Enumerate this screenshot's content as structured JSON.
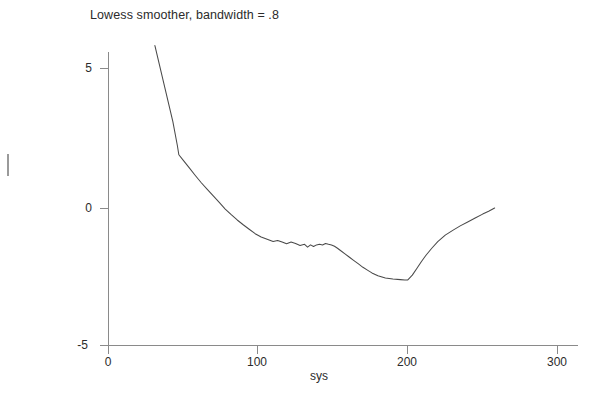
{
  "chart_data": {
    "type": "line",
    "title": "Lowess smoother, bandwidth = .8",
    "xlabel": "sys",
    "ylabel": "",
    "xlim": [
      0,
      310
    ],
    "ylim": [
      -5.3,
      6.3
    ],
    "xticks": [
      "0",
      "100",
      "200",
      "300"
    ],
    "xtick_values": [
      0,
      100,
      200,
      300
    ],
    "yticks": [
      "5",
      "0",
      "-5"
    ],
    "ytick_values": [
      5,
      0,
      -5
    ],
    "grid": false,
    "legend": "none",
    "series": [
      {
        "name": "lowess smooth",
        "color": "#4a4a4a",
        "x": [
          31,
          34,
          37,
          40,
          43,
          46,
          47,
          50,
          54,
          58,
          62,
          66,
          70,
          74,
          78,
          82,
          86,
          90,
          94,
          98,
          102,
          106,
          110,
          113,
          116,
          119,
          122,
          125,
          128,
          131,
          133,
          135,
          137,
          139,
          141,
          143,
          145,
          147,
          149,
          151,
          153,
          155,
          158,
          161,
          164,
          167,
          170,
          173,
          176,
          180,
          185,
          190,
          195,
          198,
          200,
          203,
          206,
          209,
          212,
          216,
          220,
          225,
          230,
          235,
          240,
          245,
          250,
          254,
          258
        ],
        "y": [
          5.82,
          5.14,
          4.46,
          3.78,
          3.1,
          2.25,
          1.92,
          1.72,
          1.45,
          1.18,
          0.92,
          0.68,
          0.45,
          0.22,
          -0.02,
          -0.22,
          -0.41,
          -0.58,
          -0.74,
          -0.9,
          -1.02,
          -1.1,
          -1.18,
          -1.14,
          -1.2,
          -1.26,
          -1.2,
          -1.25,
          -1.32,
          -1.28,
          -1.38,
          -1.3,
          -1.36,
          -1.3,
          -1.28,
          -1.3,
          -1.25,
          -1.28,
          -1.3,
          -1.35,
          -1.42,
          -1.5,
          -1.62,
          -1.74,
          -1.86,
          -1.98,
          -2.1,
          -2.2,
          -2.3,
          -2.4,
          -2.48,
          -2.52,
          -2.54,
          -2.55,
          -2.55,
          -2.38,
          -2.14,
          -1.9,
          -1.68,
          -1.42,
          -1.18,
          -0.95,
          -0.78,
          -0.62,
          -0.48,
          -0.34,
          -0.2,
          -0.1,
          0.02
        ]
      }
    ]
  },
  "figure": {
    "title": "Lowess smoother, bandwidth = .8",
    "x_axis_label": "sys",
    "x_tick_labels": [
      "0",
      "100",
      "200",
      "300"
    ],
    "y_tick_labels": [
      "5",
      "0",
      "-5"
    ]
  },
  "page": {
    "caption_fragment": "The smoothed scatterplot suggests a systematic trend."
  }
}
